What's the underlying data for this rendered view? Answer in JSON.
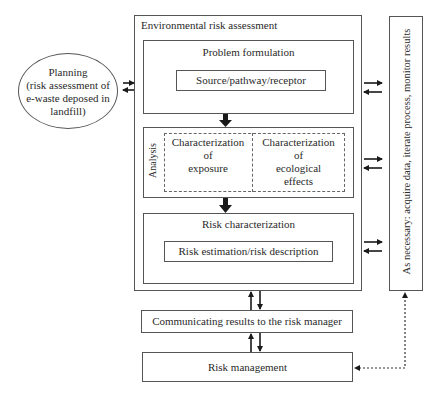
{
  "planning": {
    "title": "Planning",
    "lines": [
      "(risk assessment of",
      "e-waste deposed in",
      "landfill)"
    ]
  },
  "era": {
    "title": "Environmental risk assessment",
    "problem_formulation": {
      "title": "Problem formulation",
      "inner": "Source/pathway/receptor"
    },
    "analysis": {
      "label": "Analysis",
      "exposure": [
        "Characterization",
        "of",
        "exposure"
      ],
      "ecological": [
        "Characterization",
        "of",
        "ecological",
        "effects"
      ]
    },
    "risk_characterization": {
      "title": "Risk characterization",
      "inner": "Risk estimation/risk description"
    }
  },
  "side_box": {
    "text": "As necessary: acquire data, iterate process, monitor results"
  },
  "communicating": {
    "text": "Communicating results to the risk manager"
  },
  "risk_management": {
    "text": "Risk management"
  },
  "colors": {
    "line": "#555555",
    "text": "#2a2a2a",
    "arrow": "#1a1a1a"
  }
}
